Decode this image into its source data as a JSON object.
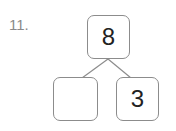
{
  "problem": {
    "number": "11."
  },
  "number_bond": {
    "whole": "8",
    "parts": [
      "",
      "3"
    ]
  },
  "colors": {
    "border": "#8c8c8c",
    "text": "#222222",
    "label": "#8a8a8a"
  }
}
